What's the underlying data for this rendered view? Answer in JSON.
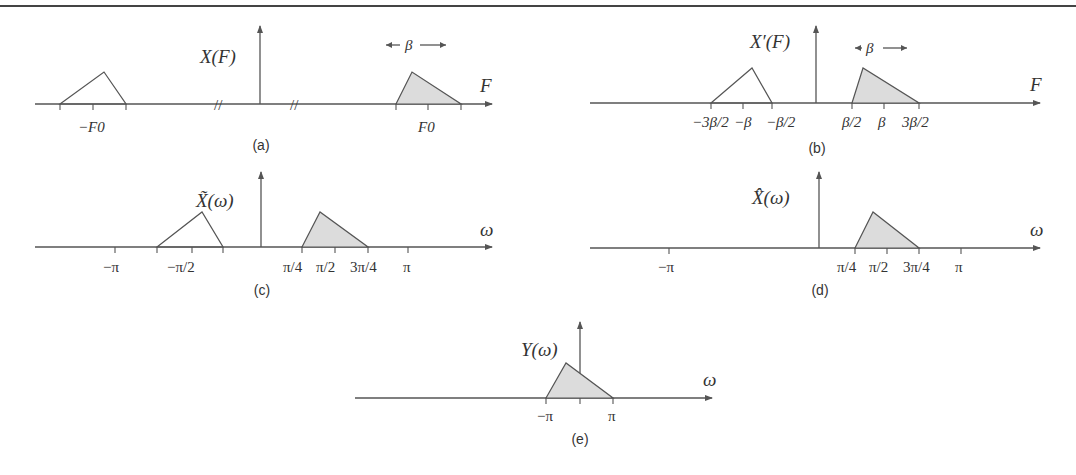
{
  "figure": {
    "panels": [
      {
        "id": "a",
        "caption": "(a)",
        "ylabel": "X(F)",
        "xlabel": "F",
        "ticks": [
          "−F0",
          "F0"
        ],
        "bandwidth_label": "β",
        "break_marks": "//"
      },
      {
        "id": "b",
        "caption": "(b)",
        "ylabel": "X′(F)",
        "xlabel": "F",
        "ticks": [
          "−3β/2",
          "−β",
          "−β/2",
          "β/2",
          "β",
          "3β/2"
        ],
        "bandwidth_label": "β"
      },
      {
        "id": "c",
        "caption": "(c)",
        "ylabel": "X̃(ω)",
        "xlabel": "ω",
        "ticks": [
          "−π",
          "−π/2",
          "π/4",
          "π/2",
          "3π/4",
          "π"
        ]
      },
      {
        "id": "d",
        "caption": "(d)",
        "ylabel": "X̂(ω)",
        "xlabel": "ω",
        "ticks": [
          "−π",
          "π/4",
          "π/2",
          "3π/4",
          "π"
        ]
      },
      {
        "id": "e",
        "caption": "(e)",
        "ylabel": "Y(ω)",
        "xlabel": "ω",
        "ticks": [
          "−π",
          "π"
        ]
      }
    ]
  }
}
